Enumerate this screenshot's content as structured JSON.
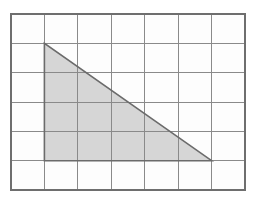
{
  "figure": {
    "kind": "grid-with-shaded-triangle",
    "background_color": "#fdfdfd",
    "canvas": {
      "width": 256,
      "height": 205
    }
  },
  "grid": {
    "name": "square-grid",
    "columns": 7,
    "rows": 6,
    "cell_width": 33.4,
    "cell_height": 29.3,
    "origin_x": 11,
    "origin_y": 14,
    "line_color": "#8a8a8a",
    "line_width": 1,
    "border_color": "#6e6e6e",
    "border_width": 1.2,
    "vertical_line_x": [
      11,
      44.4,
      77.9,
      111.3,
      144.7,
      178.1,
      211.6,
      245
    ],
    "horizontal_line_y": [
      14,
      43.3,
      72.7,
      102,
      131.3,
      160.7,
      190
    ]
  },
  "triangle": {
    "name": "shaded-right-triangle",
    "fill_color": "#d6d6d6",
    "stroke_color": "#6b6b6b",
    "stroke_width": 1.6,
    "vertices_px": [
      {
        "label": "apex",
        "x": 44.4,
        "y": 43.3
      },
      {
        "label": "bottom-left",
        "x": 44.4,
        "y": 160.7
      },
      {
        "label": "bottom-right",
        "x": 211.6,
        "y": 160.7
      }
    ],
    "vertices_grid": [
      {
        "label": "apex",
        "col": 1,
        "row": 1
      },
      {
        "label": "bottom-left",
        "col": 1,
        "row": 5
      },
      {
        "label": "bottom-right",
        "col": 6,
        "row": 5
      }
    ],
    "base_units": 5,
    "height_units": 4,
    "area_units": 10,
    "right_angle_at": "bottom-left"
  }
}
